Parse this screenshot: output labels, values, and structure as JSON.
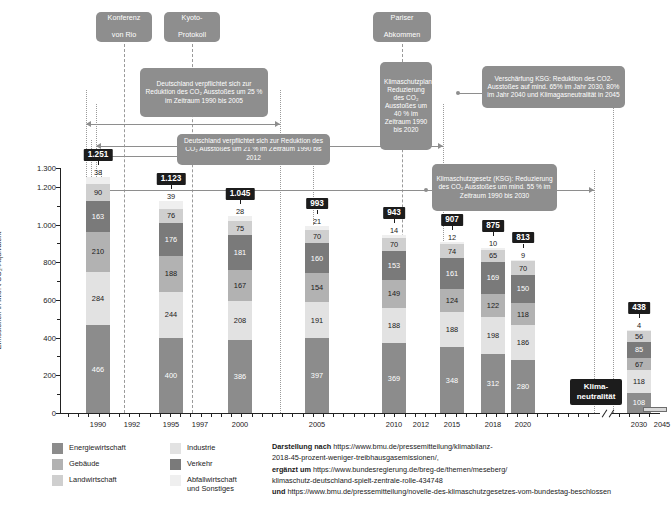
{
  "chart_data": {
    "type": "bar",
    "stacked": true,
    "title": "",
    "xlabel": "",
    "ylabel": "Emissionen in Mio. t CO₂-Äquivalent",
    "ylim": [
      0,
      1300
    ],
    "yticks": [
      "0",
      "200",
      "400",
      "600",
      "800",
      "1.000",
      "1.200",
      "1.300"
    ],
    "ytick_values": [
      0,
      200,
      400,
      600,
      800,
      1000,
      1200,
      1300
    ],
    "minor_ticks": [
      100,
      300,
      500,
      700,
      900,
      1100
    ],
    "grid": false,
    "legend_position": "bottom-left",
    "categories": [
      "1990",
      "1995",
      "2000",
      "2005",
      "2010",
      "2015",
      "2018",
      "2020",
      "2030"
    ],
    "xtick_labels": [
      "1990",
      "1992",
      "1995",
      "1997",
      "2000",
      "2005",
      "2010",
      "2012",
      "2015",
      "2018",
      "2020",
      "2030",
      "2045"
    ],
    "series": [
      {
        "name": "Energiewirtschaft",
        "color": "#8c8c8c",
        "values": [
          466,
          400,
          386,
          397,
          369,
          348,
          312,
          280,
          108
        ]
      },
      {
        "name": "Industrie",
        "color": "#e2e2e2",
        "values": [
          284,
          244,
          208,
          191,
          188,
          188,
          198,
          186,
          118
        ]
      },
      {
        "name": "Gebäude",
        "color": "#b2b2b2",
        "values": [
          210,
          188,
          167,
          154,
          149,
          124,
          122,
          118,
          67
        ]
      },
      {
        "name": "Verkehr",
        "color": "#7a7a7a",
        "values": [
          163,
          176,
          181,
          160,
          153,
          161,
          169,
          150,
          85
        ]
      },
      {
        "name": "Landwirtschaft",
        "color": "#cfcfcf",
        "values": [
          90,
          76,
          75,
          70,
          70,
          74,
          65,
          70,
          56
        ]
      },
      {
        "name": "Abfallwirtschaft und Sonstiges",
        "color": "#efefef",
        "values": [
          38,
          39,
          28,
          21,
          14,
          12,
          10,
          9,
          4
        ]
      }
    ],
    "totals": [
      "1.251",
      "1.123",
      "1.045",
      "993",
      "943",
      "907",
      "875",
      "813",
      "438"
    ],
    "total_values": [
      1251,
      1123,
      1045,
      993,
      943,
      907,
      875,
      813,
      438
    ],
    "annotations": [
      "Konferenz von Rio (1992)",
      "Kyoto-Protokoll (1997)",
      "Pariser Abkommen (2015)",
      "Klimaneutralität (2045)"
    ]
  },
  "events": [
    {
      "id": "rio",
      "line1": "Konferenz",
      "line2": "von Rio"
    },
    {
      "id": "kyoto",
      "line1": "Kyoto-",
      "line2": "Protokoll"
    },
    {
      "id": "paris",
      "line1": "Pariser",
      "line2": "Abkommen"
    }
  ],
  "targets": {
    "t2005": "Deutschland verpflichtet sich zur Reduktion des CO₂ Ausstoßes um 25 % im Zeitraum 1990 bis 2005",
    "t2012": "Deutschland verpflichtet sich zur Reduktion des CO₂ Ausstoßes um 21 % im Zeitraum 1990 bis 2012",
    "t2020": "Klimaschutzplan: Reduzierung des CO₂ Ausstoßes um 40 % im Zeitraum 1990 bis 2020",
    "ksg2030": "Klimaschutzgesetz (KSG): Reduzierung des CO₂ Ausstoßes um mind. 55 % im Zeitraum 1990 bis 2030",
    "ksg_versch": "Verschärfung KSG: Reduktion des CO2-Ausstoßes auf mind. 65% im Jahr 2030, 80% im Jahr 2040 und Klimagasneutralität in 2045"
  },
  "neutral": {
    "line1": "Klima-",
    "line2": "neutralität"
  },
  "legend": {
    "items": [
      {
        "label": "Energiewirtschaft",
        "color": "#8c8c8c"
      },
      {
        "label": "Gebäude",
        "color": "#b2b2b2"
      },
      {
        "label": "Landwirtschaft",
        "color": "#cfcfcf"
      },
      {
        "label": "Industrie",
        "color": "#e2e2e2"
      },
      {
        "label": "Verkehr",
        "color": "#7a7a7a"
      },
      {
        "label": "Abfallwirtschaft",
        "color": "#efefef",
        "label2": "und Sonstiges"
      }
    ]
  },
  "source": {
    "l1_b": "Darstellung nach ",
    "l1_t": "https://www.bmu.de/pressemitteilung/klimabilanz-",
    "l2_t": "2018-45-prozent-weniger-treibhausgasemissionen/,",
    "l3_b": "ergänzt um ",
    "l3_t": "https://www.bundesregierung.de/breg-de/themen/meseberg/",
    "l4_t": "klimaschutz-deutschland-spielt-zentrale-rolle-434748",
    "l5_b": "und ",
    "l5_t": "https://www.bmu.de/pressemitteilung/novelle-des-klimaschutzgesetzes-vom-bundestag-beschlossen"
  }
}
